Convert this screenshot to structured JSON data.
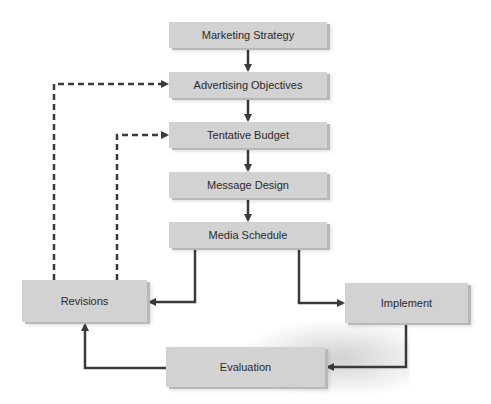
{
  "diagram": {
    "nodes": [
      {
        "id": "marketing_strategy",
        "label": "Marketing Strategy"
      },
      {
        "id": "advertising_objectives",
        "label": "Advertising Objectives"
      },
      {
        "id": "tentative_budget",
        "label": "Tentative Budget"
      },
      {
        "id": "message_design",
        "label": "Message Design"
      },
      {
        "id": "media_schedule",
        "label": "Media Schedule"
      },
      {
        "id": "revisions",
        "label": "Revisions"
      },
      {
        "id": "implement",
        "label": "Implement"
      },
      {
        "id": "evaluation",
        "label": "Evaluation"
      }
    ],
    "edges": [
      {
        "from": "marketing_strategy",
        "to": "advertising_objectives",
        "style": "solid"
      },
      {
        "from": "advertising_objectives",
        "to": "tentative_budget",
        "style": "solid"
      },
      {
        "from": "tentative_budget",
        "to": "message_design",
        "style": "solid"
      },
      {
        "from": "message_design",
        "to": "media_schedule",
        "style": "solid"
      },
      {
        "from": "media_schedule",
        "to": "revisions",
        "style": "solid"
      },
      {
        "from": "media_schedule",
        "to": "implement",
        "style": "solid"
      },
      {
        "from": "implement",
        "to": "evaluation",
        "style": "solid"
      },
      {
        "from": "evaluation",
        "to": "revisions",
        "style": "solid"
      },
      {
        "from": "revisions",
        "to": "advertising_objectives",
        "style": "dashed"
      },
      {
        "from": "revisions",
        "to": "tentative_budget",
        "style": "dashed"
      }
    ],
    "colors": {
      "box": "#d2d2d2",
      "arrow": "#3a3a3a",
      "text": "#2a2a2a"
    }
  }
}
